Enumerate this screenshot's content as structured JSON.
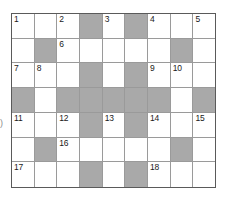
{
  "puzzle": {
    "type": "crossword-grid",
    "columns": 9,
    "rows": 7,
    "colors": {
      "blocked_cell": "#a9a9a9",
      "open_cell": "#ffffff",
      "grid_line": "#9a9a9a",
      "border": "#5a5a5a",
      "number_text": "#1a1a1a"
    },
    "edge_mark": ")",
    "grid": [
      [
        {
          "number": "1",
          "shaded": false
        },
        {
          "number": "",
          "shaded": false
        },
        {
          "number": "2",
          "shaded": false
        },
        {
          "number": "",
          "shaded": true
        },
        {
          "number": "3",
          "shaded": false
        },
        {
          "number": "",
          "shaded": true
        },
        {
          "number": "4",
          "shaded": false
        },
        {
          "number": "",
          "shaded": false
        },
        {
          "number": "5",
          "shaded": false
        }
      ],
      [
        {
          "number": "",
          "shaded": false
        },
        {
          "number": "",
          "shaded": true
        },
        {
          "number": "6",
          "shaded": false
        },
        {
          "number": "",
          "shaded": false
        },
        {
          "number": "",
          "shaded": false
        },
        {
          "number": "",
          "shaded": false
        },
        {
          "number": "",
          "shaded": false
        },
        {
          "number": "",
          "shaded": true
        },
        {
          "number": "",
          "shaded": false
        }
      ],
      [
        {
          "number": "7",
          "shaded": false
        },
        {
          "number": "8",
          "shaded": false
        },
        {
          "number": "",
          "shaded": false
        },
        {
          "number": "",
          "shaded": true
        },
        {
          "number": "",
          "shaded": false
        },
        {
          "number": "",
          "shaded": true
        },
        {
          "number": "9",
          "shaded": false
        },
        {
          "number": "10",
          "shaded": false
        },
        {
          "number": "",
          "shaded": false
        }
      ],
      [
        {
          "number": "",
          "shaded": true
        },
        {
          "number": "",
          "shaded": false
        },
        {
          "number": "",
          "shaded": true
        },
        {
          "number": "",
          "shaded": true
        },
        {
          "number": "",
          "shaded": true
        },
        {
          "number": "",
          "shaded": true
        },
        {
          "number": "",
          "shaded": true
        },
        {
          "number": "",
          "shaded": false
        },
        {
          "number": "",
          "shaded": true
        }
      ],
      [
        {
          "number": "11",
          "shaded": false
        },
        {
          "number": "",
          "shaded": false
        },
        {
          "number": "12",
          "shaded": false
        },
        {
          "number": "",
          "shaded": true
        },
        {
          "number": "13",
          "shaded": false
        },
        {
          "number": "",
          "shaded": true
        },
        {
          "number": "14",
          "shaded": false
        },
        {
          "number": "",
          "shaded": false
        },
        {
          "number": "15",
          "shaded": false
        }
      ],
      [
        {
          "number": "",
          "shaded": false
        },
        {
          "number": "",
          "shaded": true
        },
        {
          "number": "16",
          "shaded": false
        },
        {
          "number": "",
          "shaded": false
        },
        {
          "number": "",
          "shaded": false
        },
        {
          "number": "",
          "shaded": false
        },
        {
          "number": "",
          "shaded": false
        },
        {
          "number": "",
          "shaded": true
        },
        {
          "number": "",
          "shaded": false
        }
      ],
      [
        {
          "number": "17",
          "shaded": false
        },
        {
          "number": "",
          "shaded": false
        },
        {
          "number": "",
          "shaded": false
        },
        {
          "number": "",
          "shaded": true
        },
        {
          "number": "",
          "shaded": false
        },
        {
          "number": "",
          "shaded": true
        },
        {
          "number": "18",
          "shaded": false
        },
        {
          "number": "",
          "shaded": false
        },
        {
          "number": "",
          "shaded": false
        }
      ]
    ]
  }
}
